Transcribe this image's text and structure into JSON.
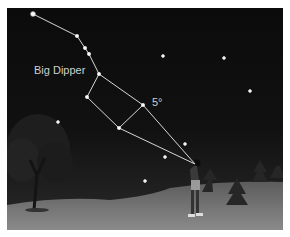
{
  "diagram": {
    "title_label": "Big Dipper",
    "angle_label": "5°",
    "colors": {
      "sky": "#0d0d0d",
      "ground": "#6e6e6e",
      "star": "#ffffff",
      "line": "#d8d8d8",
      "label": "#cfcfcf"
    },
    "constellation_stars": [
      {
        "x": 33,
        "y": 14
      },
      {
        "x": 77,
        "y": 36
      },
      {
        "x": 85,
        "y": 48
      },
      {
        "x": 89,
        "y": 54
      },
      {
        "x": 99,
        "y": 74
      },
      {
        "x": 87,
        "y": 97
      },
      {
        "x": 143,
        "y": 105
      },
      {
        "x": 119,
        "y": 128
      }
    ],
    "background_stars": [
      {
        "x": 163,
        "y": 56
      },
      {
        "x": 224,
        "y": 58
      },
      {
        "x": 250,
        "y": 91
      },
      {
        "x": 58,
        "y": 122
      },
      {
        "x": 185,
        "y": 144
      },
      {
        "x": 165,
        "y": 157
      },
      {
        "x": 145,
        "y": 181
      }
    ],
    "observer": {
      "x": 196,
      "y": 164
    }
  }
}
